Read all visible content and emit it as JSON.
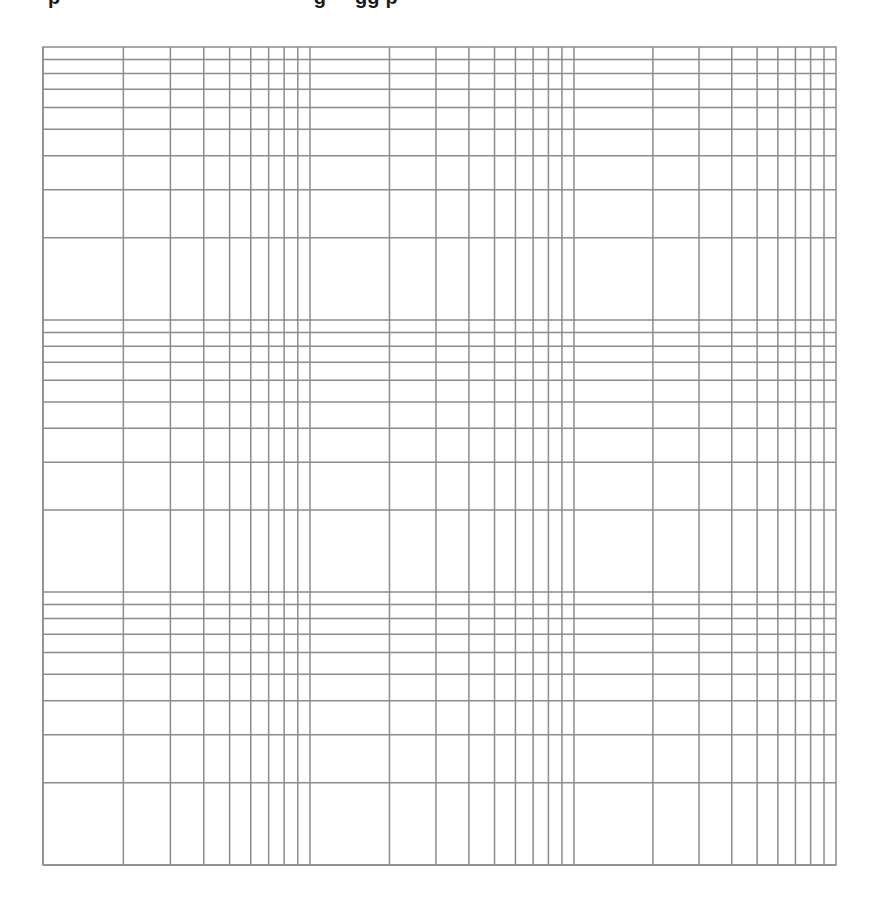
{
  "page": {
    "title_visible": false,
    "title_note": "Only the descenders of a bold title line are visible at the top edge; the text itself is cut off."
  },
  "style": {
    "background": "#ffffff",
    "grid_color": "#8c8c8c",
    "grid_width": 1.5
  },
  "chart_data": {
    "type": "grid",
    "subtype": "log-log graph paper",
    "title": "",
    "xlabel": "",
    "ylabel": "",
    "x_scale": "log",
    "y_scale": "log",
    "x_decades": 3,
    "y_decades": 3,
    "grid": true,
    "legend": null,
    "plot_area_px": {
      "left": 43,
      "top": 47,
      "right": 836,
      "bottom": 865
    },
    "x_decade_bounds_px": [
      43,
      310,
      574,
      836
    ],
    "y_decade_bounds_px": [
      47,
      320,
      592,
      865
    ],
    "y_direction": "values increase upward (decade boundary lines at top, dense lines near top of each decade)",
    "minor_lines_per_decade": [
      2,
      3,
      4,
      5,
      6,
      7,
      8,
      9
    ],
    "series": []
  }
}
